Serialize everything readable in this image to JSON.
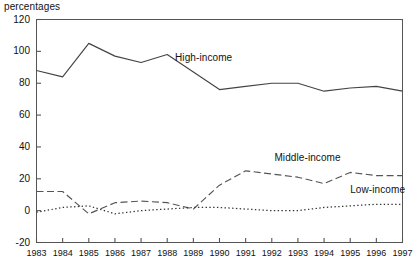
{
  "units_label": "percentages",
  "chart_data": {
    "type": "line",
    "title": "",
    "subtitle": "",
    "xlabel": "",
    "ylabel": "percentages",
    "ylim": [
      -20,
      120
    ],
    "yticks": [
      -20,
      0,
      20,
      40,
      60,
      80,
      100,
      120
    ],
    "ytick_labels": [
      "-20",
      "0",
      "20",
      "40",
      "60",
      "80",
      "100",
      "120"
    ],
    "grid": false,
    "legend_position": "inline-annotations",
    "x": [
      1983,
      1984,
      1985,
      1986,
      1987,
      1988,
      1989,
      1990,
      1991,
      1992,
      1993,
      1994,
      1995,
      1996,
      1997
    ],
    "categories": [
      "1983",
      "1984",
      "1985",
      "1986",
      "1987",
      "1988",
      "1989",
      "1990",
      "1991",
      "1992",
      "1993",
      "1994",
      "1995",
      "1996",
      "1997"
    ],
    "series": [
      {
        "name": "High-income",
        "style": "solid",
        "color": "#444444",
        "values": [
          88,
          84,
          105,
          97,
          93,
          98,
          87,
          76,
          78,
          80,
          80,
          75,
          77,
          78,
          75
        ]
      },
      {
        "name": "Middle-income",
        "style": "dashed",
        "color": "#555555",
        "values": [
          12,
          12,
          -2,
          5,
          6,
          5,
          1,
          16,
          25,
          23,
          21,
          17,
          24,
          22,
          22
        ]
      },
      {
        "name": "Low-income",
        "style": "dotted",
        "color": "#333333",
        "values": [
          -1,
          2,
          3,
          -2,
          0,
          1,
          2,
          2,
          1,
          0,
          0,
          2,
          3,
          4,
          4
        ]
      }
    ],
    "annotations": [
      {
        "text": "High-income",
        "x": 1988.3,
        "y": 96
      },
      {
        "text": "Middle-income",
        "x": 1992.1,
        "y": 33
      },
      {
        "text": "Low-income",
        "x": 1995.0,
        "y": 13
      }
    ]
  }
}
